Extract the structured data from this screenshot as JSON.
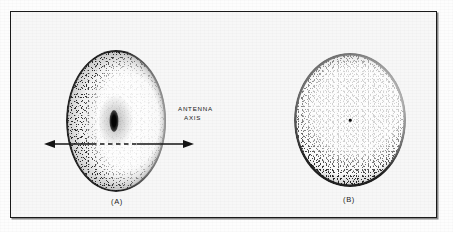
{
  "figure": {
    "background_color": "#f7f7f7",
    "frame_color": "#1a1a1a",
    "ink_color": "#111111"
  },
  "panels": [
    {
      "id": "a",
      "caption": "(A)",
      "view": "oblique",
      "shape": "ellipse",
      "description": "parabolic antenna dish seen obliquely with dark stippled rim and dark focal feed blob at centre"
    },
    {
      "id": "b",
      "caption": "(B)",
      "view": "face-on",
      "shape": "circle",
      "description": "same parabolic antenna dish seen along the antenna axis, stippled disc with dark rim and small centre dot"
    }
  ],
  "annotations": {
    "axis_label_line1": "ANTENNA",
    "axis_label_line2": "AXIS",
    "axis_arrow": "double-headed-arrow",
    "axis_line_style": "dashed-inside-solid-outside"
  },
  "icons": {
    "arrow_left": "arrow-left-icon",
    "arrow_right": "arrow-right-icon"
  }
}
